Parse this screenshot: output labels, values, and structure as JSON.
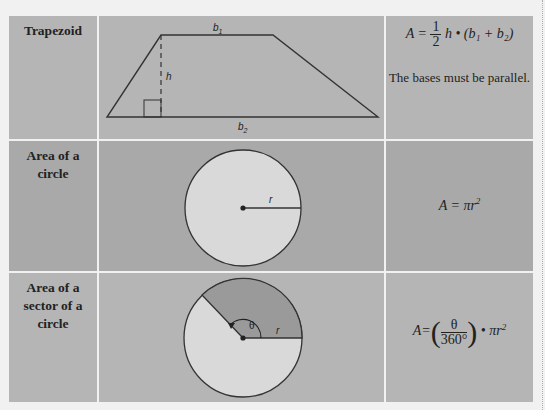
{
  "rows": [
    {
      "label": "Trapezoid",
      "diagram": {
        "top_base": "b",
        "top_base_sub": "1",
        "bottom_base": "b",
        "bottom_base_sub": "2",
        "height": "h"
      },
      "formula": {
        "lhs": "A =",
        "num": "1",
        "den": "2",
        "rest": "h • (b₁ + b₂)"
      },
      "note": "The bases must be parallel."
    },
    {
      "label_lines": [
        "Area of a",
        "circle"
      ],
      "diagram": {
        "radius": "r"
      },
      "formula": {
        "text": "A = πr",
        "exp": "2"
      }
    },
    {
      "label_lines": [
        "Area of a",
        "sector of a",
        "circle"
      ],
      "diagram": {
        "radius": "r",
        "angle": "θ"
      },
      "formula": {
        "lhs": "A=",
        "num": "θ",
        "den": "360°",
        "rest": "• πr",
        "exp": "2"
      }
    }
  ],
  "colors": {
    "background": "#f1f1f1",
    "cell": "#b5b5b5",
    "cell_dark": "#a9a9a9",
    "shape_fill": "#d9d9d9",
    "sector_fill": "#9a9a9a",
    "stroke": "#333333"
  }
}
